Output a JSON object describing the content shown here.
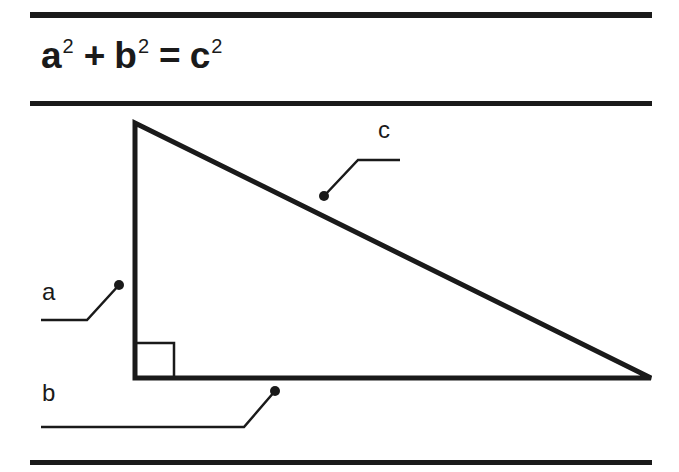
{
  "equation": {
    "term_a": "a",
    "term_b": "b",
    "term_c": "c",
    "exponent": "2",
    "plus": "+",
    "equals": "="
  },
  "labels": {
    "a": "a",
    "b": "b",
    "c": "c"
  },
  "colors": {
    "ink": "#1a1a1a",
    "background": "#ffffff"
  },
  "diagram": {
    "shape": "right-triangle",
    "vertices": {
      "top": [
        135,
        123
      ],
      "right_angle": [
        135,
        378
      ],
      "right": [
        651,
        378
      ]
    },
    "right_angle_marker": true
  }
}
